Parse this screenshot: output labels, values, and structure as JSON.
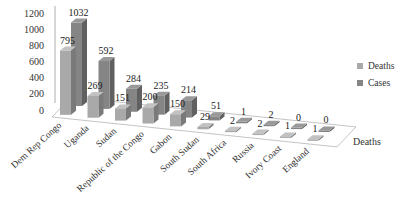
{
  "chart_data": {
    "type": "bar",
    "subtype": "3d-clustered-depth",
    "title": "",
    "xlabel": "",
    "ylabel": "",
    "depth_axis_label": "Deaths",
    "ylim": [
      0,
      1200
    ],
    "yticks": [
      0,
      200,
      400,
      600,
      800,
      1000,
      1200
    ],
    "grid": false,
    "legend_position": "right",
    "categories": [
      "Dem Rep Congo",
      "Uganda",
      "Sudan",
      "Republic of the Congo",
      "Gabon",
      "South Sudan",
      "South Africa",
      "Russia",
      "Ivory Coast",
      "England"
    ],
    "series": [
      {
        "name": "Deaths",
        "color": "#a9a9a9",
        "values": [
          795,
          269,
          151,
          200,
          150,
          29,
          2,
          2,
          1,
          1
        ]
      },
      {
        "name": "Cases",
        "color": "#858585",
        "values": [
          1032,
          592,
          284,
          235,
          214,
          51,
          1,
          2,
          0,
          0
        ]
      }
    ]
  },
  "legend": {
    "items": [
      {
        "label": "Deaths",
        "color": "#a9a9a9"
      },
      {
        "label": "Cases",
        "color": "#858585"
      }
    ]
  }
}
